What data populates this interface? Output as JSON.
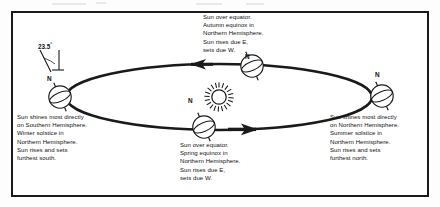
{
  "diagram": {
    "tilt": {
      "label": "23.5",
      "degree_symbol": "°",
      "axis_marker": "N"
    },
    "sun": {
      "name": "sun"
    },
    "orbit": {
      "direction": "counterclockwise"
    },
    "pole_labels": {
      "left": "N",
      "top": "N",
      "bottom": "N",
      "right": "N"
    },
    "captions": {
      "autumn": "Sun over equator.\nAutumn equinox in\nNorthern Hemisphere.\nSun rises due E,\nsets due W.",
      "spring": "Sun over equator.\nSpring equinox in\nNorthern Hemisphere.\nSun rises due E,\nsets due W.",
      "winter": "Sun shines most directly\non Southern Hemisphere.\nWinter solstice in\nNorthern Hemisphere.\nSun rises and sets\nfurthest south.",
      "summer": "Sun shines most directly\non Northern Hemisphere.\nSummer solstice in\nNorthern Hemisphere.\nSun rises and sets\nfurthest north."
    },
    "colors": {
      "ink": "#1a1a1a",
      "paper": "#ffffff"
    }
  }
}
